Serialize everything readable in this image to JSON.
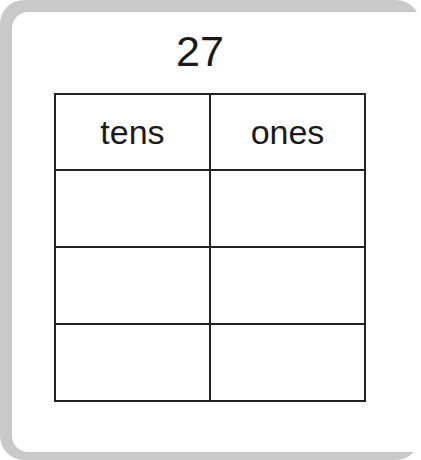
{
  "worksheet": {
    "number": "27",
    "table": {
      "headers": [
        "tens",
        "ones"
      ],
      "rows": [
        [
          "",
          ""
        ],
        [
          "",
          ""
        ],
        [
          "",
          ""
        ]
      ]
    }
  }
}
